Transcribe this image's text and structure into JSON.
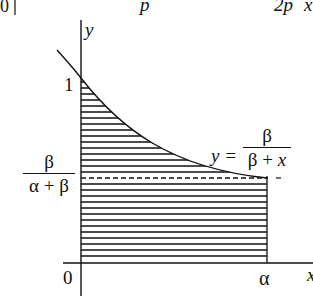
{
  "top_strip": {
    "zero": "0",
    "p": "p",
    "two_p": "2p",
    "x_cut": "x"
  },
  "axes": {
    "y_label": "y",
    "x_label": "x",
    "origin": "0",
    "one": "1",
    "alpha": "α"
  },
  "level": {
    "numerator": "β",
    "denominator": "α + β"
  },
  "curve_label": {
    "lhs": "y =",
    "numerator": "β",
    "denominator": "β + x"
  },
  "colors": {
    "ink": "#111111",
    "background": "#ffffff"
  }
}
